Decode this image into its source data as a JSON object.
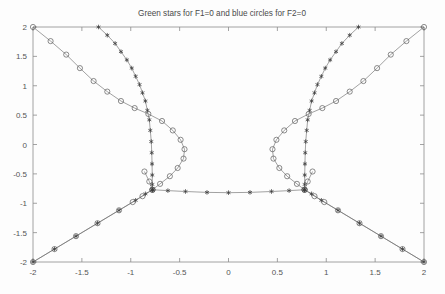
{
  "figure": {
    "title": "Green stars for F1=0 and blue circles for F2=0",
    "background_color": "#fdfdfd",
    "axis_color": "#8c8c8c"
  },
  "chart_data": {
    "type": "line",
    "title": "Green stars for F1=0 and blue circles for F2=0",
    "xlabel": "",
    "ylabel": "",
    "xlim": [
      -2,
      2
    ],
    "ylim": [
      -2,
      2
    ],
    "grid": false,
    "legend": "none",
    "xticks": [
      -2,
      -1.5,
      -1,
      -0.5,
      0,
      0.5,
      1,
      1.5,
      2
    ],
    "xticklabels": [
      "-2",
      "-1.5",
      "-1",
      "-0.5",
      "0",
      "0.5",
      "1",
      "1.5",
      "2"
    ],
    "yticks": [
      -2,
      -1.5,
      -1,
      -0.5,
      0,
      0.5,
      1,
      1.5,
      2
    ],
    "yticklabels": [
      "-2",
      "-1.5",
      "-1",
      "-0.5",
      "0",
      "0.5",
      "1",
      "1.5",
      "2"
    ],
    "marker_styles": {
      "F1": "star",
      "F2": "circle"
    },
    "series": [
      {
        "name": "F1=0 left upper branch",
        "marker": "star",
        "color": "#3c3c3c",
        "points": [
          [
            -1.33,
            2.0
          ],
          [
            -1.24,
            1.86
          ],
          [
            -1.16,
            1.72
          ],
          [
            -1.1,
            1.58
          ],
          [
            -1.04,
            1.44
          ],
          [
            -0.99,
            1.3
          ],
          [
            -0.95,
            1.16
          ],
          [
            -0.91,
            1.02
          ],
          [
            -0.88,
            0.88
          ],
          [
            -0.85,
            0.74
          ],
          [
            -0.83,
            0.58
          ],
          [
            -0.81,
            0.42
          ],
          [
            -0.8,
            0.24
          ],
          [
            -0.79,
            0.05
          ],
          [
            -0.785,
            -0.14
          ],
          [
            -0.782,
            -0.33
          ],
          [
            -0.78,
            -0.52
          ],
          [
            -0.779,
            -0.68
          ],
          [
            -0.778,
            -0.77
          ]
        ]
      },
      {
        "name": "F1=0 horizontal branch",
        "marker": "star",
        "color": "#3c3c3c",
        "points": [
          [
            -0.778,
            -0.77
          ],
          [
            -0.62,
            -0.785
          ],
          [
            -0.44,
            -0.8
          ],
          [
            -0.22,
            -0.815
          ],
          [
            0.0,
            -0.82
          ],
          [
            0.22,
            -0.815
          ],
          [
            0.44,
            -0.8
          ],
          [
            0.62,
            -0.785
          ],
          [
            0.778,
            -0.77
          ]
        ]
      },
      {
        "name": "F1=0 right upper branch",
        "marker": "star",
        "color": "#3c3c3c",
        "points": [
          [
            0.778,
            -0.77
          ],
          [
            0.779,
            -0.68
          ],
          [
            0.78,
            -0.52
          ],
          [
            0.782,
            -0.33
          ],
          [
            0.785,
            -0.14
          ],
          [
            0.79,
            0.05
          ],
          [
            0.8,
            0.24
          ],
          [
            0.81,
            0.42
          ],
          [
            0.83,
            0.58
          ],
          [
            0.85,
            0.74
          ],
          [
            0.88,
            0.88
          ],
          [
            0.91,
            1.02
          ],
          [
            0.95,
            1.16
          ],
          [
            0.99,
            1.3
          ],
          [
            1.04,
            1.44
          ],
          [
            1.1,
            1.58
          ],
          [
            1.16,
            1.72
          ],
          [
            1.24,
            1.86
          ],
          [
            1.33,
            2.0
          ]
        ]
      },
      {
        "name": "F1=0 lower-left diagonal",
        "marker": "star",
        "color": "#3c3c3c",
        "points": [
          [
            -2.0,
            -2.0
          ],
          [
            -1.78,
            -1.78
          ],
          [
            -1.56,
            -1.56
          ],
          [
            -1.34,
            -1.34
          ],
          [
            -1.12,
            -1.12
          ],
          [
            -0.95,
            -0.95
          ],
          [
            -0.85,
            -0.84
          ],
          [
            -0.778,
            -0.77
          ]
        ]
      },
      {
        "name": "F1=0 lower-right diagonal",
        "marker": "star",
        "color": "#3c3c3c",
        "points": [
          [
            0.778,
            -0.77
          ],
          [
            0.85,
            -0.84
          ],
          [
            0.95,
            -0.95
          ],
          [
            1.12,
            -1.12
          ],
          [
            1.34,
            -1.34
          ],
          [
            1.56,
            -1.56
          ],
          [
            1.78,
            -1.78
          ],
          [
            2.0,
            -2.0
          ]
        ]
      },
      {
        "name": "F2=0 left outer branch",
        "marker": "circle",
        "color": "#5c5c5c",
        "points": [
          [
            -2.0,
            2.0
          ],
          [
            -1.82,
            1.76
          ],
          [
            -1.66,
            1.53
          ],
          [
            -1.52,
            1.3
          ],
          [
            -1.38,
            1.08
          ],
          [
            -1.24,
            0.9
          ],
          [
            -1.1,
            0.74
          ],
          [
            -0.96,
            0.62
          ],
          [
            -0.82,
            0.52
          ],
          [
            -0.68,
            0.4
          ],
          [
            -0.57,
            0.24
          ],
          [
            -0.49,
            0.08
          ],
          [
            -0.45,
            -0.08
          ],
          [
            -0.46,
            -0.24
          ],
          [
            -0.52,
            -0.4
          ],
          [
            -0.6,
            -0.54
          ],
          [
            -0.7,
            -0.67
          ],
          [
            -0.778,
            -0.77
          ]
        ]
      },
      {
        "name": "F2=0 left inner diagonal",
        "marker": "circle",
        "color": "#5c5c5c",
        "points": [
          [
            -2.0,
            -2.0
          ],
          [
            -1.78,
            -1.78
          ],
          [
            -1.56,
            -1.56
          ],
          [
            -1.34,
            -1.34
          ],
          [
            -1.12,
            -1.12
          ],
          [
            -0.98,
            -0.98
          ],
          [
            -0.88,
            -0.88
          ],
          [
            -0.778,
            -0.77
          ]
        ]
      },
      {
        "name": "F2=0 left upper crossing",
        "marker": "circle",
        "color": "#5c5c5c",
        "points": [
          [
            -0.778,
            -0.77
          ],
          [
            -0.81,
            -0.63
          ],
          [
            -0.86,
            -0.46
          ]
        ]
      },
      {
        "name": "F2=0 right outer branch",
        "marker": "circle",
        "color": "#5c5c5c",
        "points": [
          [
            2.0,
            2.0
          ],
          [
            1.82,
            1.76
          ],
          [
            1.66,
            1.53
          ],
          [
            1.52,
            1.3
          ],
          [
            1.38,
            1.08
          ],
          [
            1.24,
            0.9
          ],
          [
            1.1,
            0.74
          ],
          [
            0.96,
            0.62
          ],
          [
            0.82,
            0.52
          ],
          [
            0.68,
            0.4
          ],
          [
            0.57,
            0.24
          ],
          [
            0.49,
            0.08
          ],
          [
            0.45,
            -0.08
          ],
          [
            0.46,
            -0.24
          ],
          [
            0.52,
            -0.4
          ],
          [
            0.6,
            -0.54
          ],
          [
            0.7,
            -0.67
          ],
          [
            0.778,
            -0.77
          ]
        ]
      },
      {
        "name": "F2=0 right inner diagonal",
        "marker": "circle",
        "color": "#5c5c5c",
        "points": [
          [
            0.778,
            -0.77
          ],
          [
            0.88,
            -0.88
          ],
          [
            0.98,
            -0.98
          ],
          [
            1.12,
            -1.12
          ],
          [
            1.34,
            -1.34
          ],
          [
            1.56,
            -1.56
          ],
          [
            1.78,
            -1.78
          ],
          [
            2.0,
            -2.0
          ]
        ]
      },
      {
        "name": "F2=0 right upper crossing",
        "marker": "circle",
        "color": "#5c5c5c",
        "points": [
          [
            0.778,
            -0.77
          ],
          [
            0.81,
            -0.63
          ],
          [
            0.86,
            -0.46
          ]
        ]
      }
    ]
  }
}
